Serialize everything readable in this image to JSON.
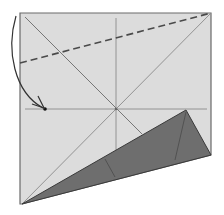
{
  "diagram": {
    "type": "origami-fold-step",
    "colors": {
      "background": "#ffffff",
      "paper": "#dcdcdc",
      "paper_edge": "#6a6a6a",
      "crease": "#8a8a8a",
      "flap": "#6e6e6e",
      "flap_edge": "#3a3a3a",
      "dash": "#4a4a4a",
      "arrow": "#333333"
    },
    "elements": [
      {
        "name": "paper-sheet",
        "kind": "polygon"
      },
      {
        "name": "valley-fold-line",
        "kind": "dashed-line"
      },
      {
        "name": "fold-arrow",
        "kind": "curved-arrow"
      },
      {
        "name": "reference-point",
        "kind": "dot"
      },
      {
        "name": "folded-flap",
        "kind": "polygon"
      }
    ]
  }
}
